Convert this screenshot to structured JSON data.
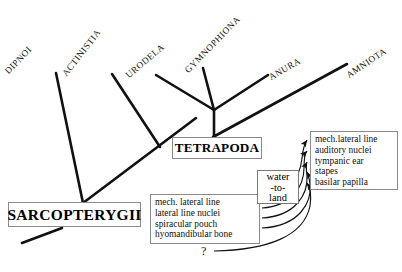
{
  "diagram": {
    "type": "cladogram",
    "taxa": [
      {
        "name": "taxon-dipnoi",
        "label": "DIPNOI"
      },
      {
        "name": "taxon-actinistia",
        "label": "ACTINISTIA"
      },
      {
        "name": "taxon-urodela",
        "label": "URODELA"
      },
      {
        "name": "taxon-gymnophiona",
        "label": "GYMNOPHIONA"
      },
      {
        "name": "taxon-anura",
        "label": "ANURA"
      },
      {
        "name": "taxon-amniota",
        "label": "AMNIOTA"
      }
    ],
    "clades": {
      "sarcopterygii": "SARCOPTERYGII",
      "tetrapoda": "TETRAPODA"
    },
    "traits_left": {
      "items": [
        "mech. lateral line",
        "lateral line nuclei",
        "spiracular pouch",
        "hyomandibular bone"
      ]
    },
    "traits_right": {
      "items": [
        "mech.lateral line",
        "auditory nuclei",
        "tympanic ear",
        "stapes",
        "basilar papilla"
      ]
    },
    "transition": {
      "line1": "water",
      "line2": "-to-",
      "line3": "land"
    },
    "uncertainty_marker": "?",
    "colors": {
      "line": "#111111",
      "box_border": "#8a8a8a",
      "background": "#ffffff",
      "text": "#111111"
    }
  }
}
